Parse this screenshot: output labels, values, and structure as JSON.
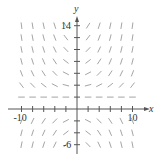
{
  "chart_data": {
    "type": "slope-field",
    "title": "",
    "xlabel": "x",
    "ylabel": "y",
    "xlim": [
      -10,
      10
    ],
    "ylim": [
      -6,
      14
    ],
    "x_tick_labels": [
      "-10",
      "10"
    ],
    "y_tick_labels": [
      "14",
      "-6"
    ],
    "x_ticks": [
      -10,
      -8,
      -6,
      -4,
      -2,
      2,
      4,
      6,
      8,
      10
    ],
    "y_ticks": [
      -6,
      -4,
      -2,
      2,
      4,
      6,
      8,
      10,
      12,
      14
    ],
    "grid_spacing": 2,
    "grid": false,
    "segment_color": "#9a9a9a",
    "axis_color": "#555555"
  },
  "axes": {
    "x_label": "x",
    "y_label": "y",
    "x_min_label": "-10",
    "x_max_label": "10",
    "y_max_label": "14",
    "y_min_label": "-6"
  }
}
